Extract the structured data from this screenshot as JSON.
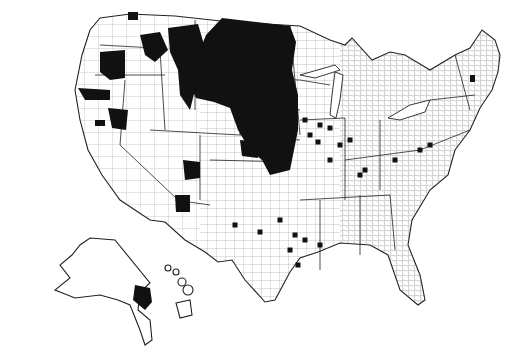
{
  "map": {
    "title": "United States counties map",
    "colors": {
      "background": "#ffffff",
      "highlight": "#111111",
      "border": "#222222"
    },
    "conus_outline": "M100,18 L130,14 L175,16 L230,22 L300,26 L330,40 L345,45 L352,38 L372,60 L390,52 L405,55 L430,70 L455,55 L470,48 L482,30 L495,40 L500,55 L498,72 L492,90 L480,108 L470,130 L455,150 L448,175 L430,190 L412,220 L408,245 L420,275 L425,300 L418,305 L400,290 L388,255 L370,245 L340,243 L318,252 L300,258 L290,272 L275,300 L265,302 L245,280 L232,260 L218,262 L205,252 L185,240 L165,222 L150,220 L120,200 L102,175 L88,150 L80,120 L75,90 L82,55 L90,30 Z",
    "great_lakes": [
      "M335,72 L343,75 L340,100 L336,118 L330,115 L332,95 Z",
      "M300,75 L335,65 L340,70 L315,78 Z",
      "M388,118 L410,105 L430,100 L425,112 L400,120 Z"
    ],
    "state_lines": [
      "M100,45 L155,48",
      "M95,75 L165,75",
      "M160,50 L165,130",
      "M195,20 L195,110",
      "M180,70 L245,78",
      "M125,80 L120,145",
      "M120,145 L178,200",
      "M150,130 L240,135",
      "M240,30 L240,135",
      "M245,78 L300,80",
      "M245,105 L300,110",
      "M290,26 L300,135",
      "M240,135 L300,140",
      "M200,135 L200,200",
      "M175,200 L210,205",
      "M210,160 L290,162",
      "M300,80 L330,85",
      "M300,120 L345,118",
      "M345,118 L345,200",
      "M380,120 L380,190",
      "M345,160 L420,150",
      "M300,200 L390,195",
      "M320,200 L320,270",
      "M360,195 L360,255",
      "M390,195 L395,250",
      "M420,150 L470,130",
      "M430,100 L475,95",
      "M455,55 L470,110"
    ],
    "county_grid": {
      "west_spacing": 14,
      "central_spacing": 9,
      "east_spacing": 6
    },
    "highlighted_regions": [
      "M222,18 L290,26 L296,42 L292,70 L298,95 L298,130 L290,170 L270,175 L262,160 L250,150 L238,130 L230,108 L214,102 L196,98 L190,85 L196,60 L206,35 Z",
      "M168,28 L198,24 L205,48 L200,72 L195,90 L190,110 L180,95 L178,70 L170,52 Z",
      "M140,35 L160,32 L168,50 L155,62 L145,55 Z",
      "M100,52 L125,50 L125,78 L110,80 L100,72 Z",
      "M78,88 L110,90 L110,100 L85,100 Z",
      "M108,108 L128,110 L126,130 L112,128 Z",
      "M95,120 L105,120 L105,126 L95,126 Z",
      "M183,160 L200,162 L200,178 L185,180 Z",
      "M175,195 L190,195 L190,212 L176,212 Z",
      "M240,140 L258,142 L258,158 L242,156 Z",
      "M470,75 L475,75 L475,82 L470,82 Z",
      "M128,12 L138,12 L138,20 L128,20 Z"
    ],
    "dots": [
      [
        305,
        120
      ],
      [
        320,
        125
      ],
      [
        310,
        135
      ],
      [
        330,
        128
      ],
      [
        318,
        142
      ],
      [
        340,
        145
      ],
      [
        350,
        140
      ],
      [
        280,
        220
      ],
      [
        295,
        235
      ],
      [
        305,
        240
      ],
      [
        320,
        245
      ],
      [
        290,
        250
      ],
      [
        298,
        265
      ],
      [
        235,
        225
      ],
      [
        260,
        232
      ],
      [
        395,
        160
      ],
      [
        420,
        150
      ],
      [
        430,
        145
      ],
      [
        330,
        160
      ],
      [
        360,
        175
      ],
      [
        365,
        170
      ],
      [
        245,
        120
      ],
      [
        262,
        110
      ],
      [
        275,
        145
      ]
    ],
    "alaska_outline": "M90,238 L115,240 L150,283 L140,292 L138,310 L150,320 L152,340 L145,345 L140,330 L130,305 L118,300 L100,295 L75,298 L55,290 L70,278 L60,265 L72,255 L80,245 Z",
    "alaska_highlight": "M135,285 L150,288 L152,302 L145,310 L133,300 Z",
    "hawaii_islands": [
      [
        168,
        268,
        3
      ],
      [
        176,
        272,
        3
      ],
      [
        182,
        282,
        4
      ],
      [
        188,
        290,
        5
      ]
    ],
    "hawaii_big": "M176,303 L190,300 L192,315 L180,318 Z"
  }
}
